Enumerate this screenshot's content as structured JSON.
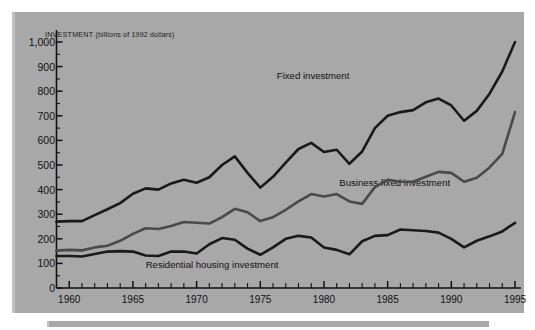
{
  "figure": {
    "axis_title_main": "INVESTMENT",
    "axis_title_unit": "(billions of 1992 dollars)",
    "background_color": "#a8a8a8",
    "axis_color": "#111111"
  },
  "chart_data": {
    "type": "line",
    "title": "INVESTMENT (billions of 1992 dollars)",
    "xlabel": "",
    "ylabel": "INVESTMENT (billions of 1992 dollars)",
    "xlim": [
      1959,
      1995
    ],
    "ylim": [
      0,
      1000
    ],
    "grid": false,
    "legend": "inline-labels",
    "ytick_labels": [
      "1,000",
      "900",
      "800",
      "700",
      "600",
      "500",
      "400",
      "300",
      "200",
      "100",
      "0"
    ],
    "ytick_values": [
      1000,
      900,
      800,
      700,
      600,
      500,
      400,
      300,
      200,
      100,
      0
    ],
    "xtick_labels": [
      "1960",
      "1965",
      "1970",
      "1975",
      "1980",
      "1985",
      "1990",
      "1995"
    ],
    "xtick_values": [
      1960,
      1965,
      1970,
      1975,
      1980,
      1985,
      1990,
      1995
    ],
    "x_minor_tick_interval": 1,
    "x": [
      1959,
      1960,
      1961,
      1962,
      1963,
      1964,
      1965,
      1966,
      1967,
      1968,
      1969,
      1970,
      1971,
      1972,
      1973,
      1974,
      1975,
      1976,
      1977,
      1978,
      1979,
      1980,
      1981,
      1982,
      1983,
      1984,
      1985,
      1986,
      1987,
      1988,
      1989,
      1990,
      1991,
      1992,
      1993,
      1994,
      1995
    ],
    "series": [
      {
        "name": "Fixed investment",
        "label": "Fixed investment",
        "color": "#1a1a1a",
        "width": 2.6,
        "label_position": {
          "x": 1976.3,
          "y": 860
        },
        "values": [
          270,
          272,
          272,
          296,
          320,
          345,
          383,
          405,
          400,
          425,
          440,
          428,
          450,
          500,
          535,
          468,
          408,
          452,
          510,
          565,
          590,
          553,
          562,
          505,
          555,
          650,
          700,
          715,
          723,
          755,
          770,
          742,
          680,
          720,
          790,
          880,
          1000
        ]
      },
      {
        "name": "Business fixed investment",
        "label": "Business fixed investment",
        "color": "#4a4a4a",
        "width": 2.6,
        "label_position": {
          "x": 1981.2,
          "y": 425
        },
        "values": [
          152,
          155,
          153,
          165,
          172,
          192,
          220,
          243,
          240,
          252,
          268,
          265,
          262,
          288,
          322,
          308,
          272,
          288,
          318,
          352,
          382,
          372,
          382,
          352,
          342,
          410,
          440,
          432,
          432,
          452,
          472,
          468,
          432,
          448,
          490,
          545,
          715
        ]
      },
      {
        "name": "Residential housing investment",
        "label": "Residential housing investment",
        "color": "#1a1a1a",
        "width": 2.6,
        "label_position": {
          "x": 1966.0,
          "y": 92
        },
        "values": [
          130,
          130,
          128,
          138,
          148,
          150,
          148,
          132,
          130,
          148,
          148,
          140,
          178,
          203,
          196,
          160,
          135,
          165,
          200,
          212,
          205,
          165,
          155,
          137,
          190,
          212,
          215,
          238,
          235,
          232,
          225,
          200,
          165,
          192,
          210,
          230,
          265
        ]
      }
    ]
  }
}
